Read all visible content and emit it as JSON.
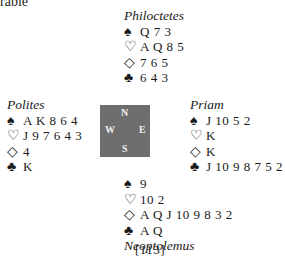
{
  "page": {
    "top_fragment": "rable",
    "page_number": "[113]"
  },
  "compass": {
    "n": "N",
    "s": "S",
    "w": "W",
    "e": "E",
    "color": "#6e6e6e"
  },
  "suits": {
    "spades": "♠",
    "hearts": "♡",
    "diamonds": "◇",
    "clubs": "♣"
  },
  "hands": {
    "north": {
      "name": "Philoctetes",
      "spades": "Q 7 3",
      "hearts": "A Q 8 5",
      "diamonds": "7 6 5",
      "clubs": "6 4 3"
    },
    "west": {
      "name": "Polites",
      "spades": "A K 8 6 4",
      "hearts": "J 9 7 6 4 3",
      "diamonds": "4",
      "clubs": "K"
    },
    "east": {
      "name": "Priam",
      "spades": "J 10 5 2",
      "hearts": "K",
      "diamonds": "K",
      "clubs": "J 10 9 8 7 5 2"
    },
    "south": {
      "name": "Neoptolemus",
      "spades": "9",
      "hearts": "10 2",
      "diamonds": "A Q J 10 9 8 3 2",
      "clubs": "A Q"
    }
  }
}
